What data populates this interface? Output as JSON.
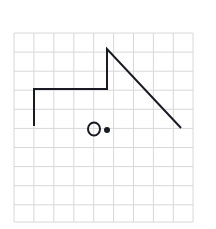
{
  "figure": {
    "background_color": "#ffffff",
    "width": 216,
    "height": 229
  },
  "grid": {
    "name": "graph-paper-grid",
    "color": "#d8d8d8",
    "line_width": 1,
    "cell_size": 19.4,
    "columns": 9,
    "rows": 10,
    "x_start": 14,
    "y_start": 33,
    "x_end": 193,
    "y_end": 222,
    "x_lines": [
      14,
      33.9,
      53.8,
      73.8,
      93.7,
      113.6,
      133.5,
      153.4,
      173.3,
      193
    ],
    "y_lines": [
      33,
      52.1,
      71.2,
      90.2,
      109.3,
      128.4,
      147.5,
      166.6,
      185.7,
      204.8,
      222
    ]
  },
  "shapes": {
    "polyline": {
      "name": "main-polyline",
      "stroke_color": "#1a1a22",
      "stroke_width": 2,
      "points": [
        {
          "x": 34,
          "y": 126
        },
        {
          "x": 34,
          "y": 89
        },
        {
          "x": 107,
          "y": 89
        },
        {
          "x": 107,
          "y": 49
        },
        {
          "x": 181,
          "y": 128
        }
      ],
      "points_string": "34,126 34,89 107,89 107,49 181,128"
    },
    "circle": {
      "name": "hollow-circle",
      "cx": 94,
      "cy": 129,
      "rx": 6,
      "ry": 6.5,
      "stroke_color": "#1a1a22",
      "stroke_width": 2,
      "fill": "none"
    },
    "dot": {
      "name": "filled-dot",
      "cx": 107,
      "cy": 130,
      "r": 3,
      "fill_color": "#1a1a22"
    }
  }
}
